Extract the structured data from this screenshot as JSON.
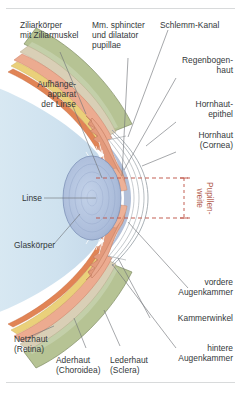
{
  "figure": {
    "title_language": "de",
    "background_color": "#ffffff",
    "accent_color": "#b2604f"
  },
  "labels": {
    "ziliarkoerper": "Ziliarkörper\nmit Ziliarmuskel",
    "sphincter": "Mm. sphincter\nund dilatator\npupillae",
    "schlemm": "Schlemm-Kanal",
    "regenbogenhaut": "Regenbogen-\nhaut",
    "hornhautepithel": "Hornhaut-\nepithel",
    "hornhaut": "Hornhaut\n(Cornea)",
    "aufhaengeapparat": "Aufhänge-\napparat\nder Linse",
    "linse": "Linse",
    "glaskoerper": "Glaskörper",
    "pupillenweite": "Pupillen-\nweite",
    "vordere_augenkammer": "vordere\nAugenkammer",
    "kammerwinkel": "Kammerwinkel",
    "hintere_augenkammer": "hintere\nAugenkammer",
    "netzhaut": "Netzhaut\n(Retina)",
    "aderhaut": "Aderhaut\n(Choroidea)",
    "lederhaut": "Lederhaut\n(Sclera)"
  },
  "colors": {
    "sclera": "#aebb8e",
    "sclera_light": "#c9d2ae",
    "episclera": "#d8cdb4",
    "choroid": "#e8a98e",
    "choroid_deep": "#d9816a",
    "retina_yellow": "#e8c85c",
    "retina_orange": "#e07a4e",
    "vitreous": "#cfe2ef",
    "anterior_chamber": "#b7c3da",
    "lens": "#aebfdc",
    "lens_ring": "#8fa3c6",
    "iris": "#e9a68c",
    "cornea_line": "#9aa2a8",
    "pupil_dash": "#c0574a",
    "leader": "#6e7276"
  },
  "pupil_marker": {
    "type": "dashed-extent",
    "upper_y": 178,
    "lower_y": 218,
    "color": "#c0574a",
    "style": "dashed"
  }
}
